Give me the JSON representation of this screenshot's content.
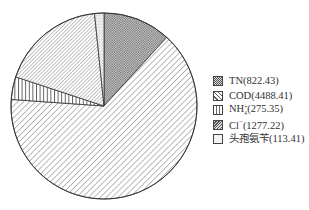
{
  "chart_data": {
    "type": "pie",
    "title": "",
    "start_angle_deg": 0,
    "direction": "clockwise",
    "legend_position": "right",
    "categories": [
      "TN",
      "COD",
      "NH4+",
      "Cl-",
      "头孢氨苄"
    ],
    "values": [
      822.43,
      4488.41,
      275.35,
      1277.22,
      113.41
    ],
    "labels": [
      "TN(822.43)",
      "COD(4488.41)",
      "NH4+(275.35)",
      "Cl⁻(1277.22)",
      "头孢氨苄(113.41)"
    ],
    "patterns": [
      "crosshatch",
      "diagonal-sparse",
      "vertical",
      "diagonal-dense",
      "stipple"
    ]
  },
  "legend": {
    "items": [
      {
        "name": "TN",
        "value": "(822.43)"
      },
      {
        "name": "COD",
        "value": "(4488.41)"
      },
      {
        "name": "NH",
        "sub": "4",
        "sup": "+",
        "value": "(275.35)"
      },
      {
        "name": "Cl",
        "sup": "−",
        "value": "(1277.22)"
      },
      {
        "name": "头孢氨苄",
        "value": "(113.41)"
      }
    ]
  }
}
